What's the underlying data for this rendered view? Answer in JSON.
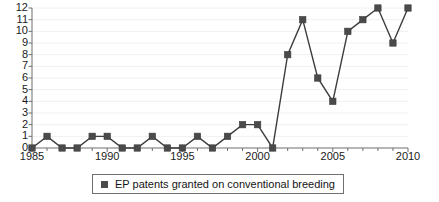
{
  "chart_data": {
    "type": "line",
    "title": "",
    "xlabel": "",
    "ylabel": "",
    "x": [
      1985,
      1986,
      1987,
      1988,
      1989,
      1990,
      1991,
      1992,
      1993,
      1994,
      1995,
      1996,
      1997,
      1998,
      1999,
      2000,
      2001,
      2002,
      2003,
      2004,
      2005,
      2006,
      2007,
      2008,
      2009,
      2010
    ],
    "series": [
      {
        "name": "EP patents granted on conventional breeding",
        "values": [
          0,
          1,
          0,
          0,
          1,
          1,
          0,
          0,
          1,
          0,
          0,
          1,
          0,
          1,
          2,
          2,
          0,
          8,
          11,
          6,
          4,
          10,
          11,
          12,
          9,
          12
        ]
      }
    ],
    "xlim": [
      1985,
      2010
    ],
    "ylim": [
      0,
      12
    ],
    "x_ticks": [
      1985,
      1990,
      1995,
      2000,
      2005,
      2010
    ],
    "x_tick_labels": [
      "1985",
      "1990",
      "1995",
      "2000",
      "2005",
      "2010"
    ],
    "x_minor_ticks": [
      1986,
      1987,
      1988,
      1989,
      1991,
      1992,
      1993,
      1994,
      1996,
      1997,
      1998,
      1999,
      2001,
      2002,
      2003,
      2004,
      2006,
      2007,
      2008,
      2009
    ],
    "y_ticks": [
      0,
      1,
      2,
      3,
      4,
      5,
      6,
      7,
      8,
      9,
      10,
      11,
      12
    ],
    "y_tick_labels": [
      "0",
      "1",
      "2",
      "3",
      "4",
      "5",
      "6",
      "7",
      "8",
      "9",
      "10",
      "11",
      "12"
    ],
    "grid": true,
    "legend_position": "bottom-center",
    "marker": "square",
    "colors": {
      "line": "#3d3d3d",
      "marker": "#4a4a4a",
      "axis": "#6f6f6f",
      "grid": "#f0f0f0",
      "text": "#1a1a1a",
      "background": "#ffffff"
    }
  },
  "legend": {
    "entries": [
      {
        "label": "EP patents granted on conventional breeding",
        "swatch": "square-marker"
      }
    ]
  }
}
